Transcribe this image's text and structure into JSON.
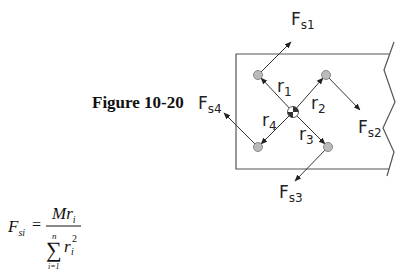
{
  "figure": {
    "caption": "Figure 10-20"
  },
  "diagram": {
    "forces": [
      {
        "base": "F",
        "sub": "s1"
      },
      {
        "base": "F",
        "sub": "s2"
      },
      {
        "base": "F",
        "sub": "s3"
      },
      {
        "base": "F",
        "sub": "s4"
      }
    ],
    "radii": [
      {
        "base": "r",
        "sub": "1"
      },
      {
        "base": "r",
        "sub": "2"
      },
      {
        "base": "r",
        "sub": "3"
      },
      {
        "base": "r",
        "sub": "4"
      }
    ]
  },
  "equation": {
    "lhs_base": "F",
    "lhs_sub": "si",
    "equals": "=",
    "numerator_M": "M",
    "numerator_r": "r",
    "numerator_sub": "i",
    "sum_symbol": "∑",
    "sum_upper": "n",
    "sum_lower": "i=1",
    "denom_r": "r",
    "denom_sub": "i",
    "denom_sup": "2"
  }
}
